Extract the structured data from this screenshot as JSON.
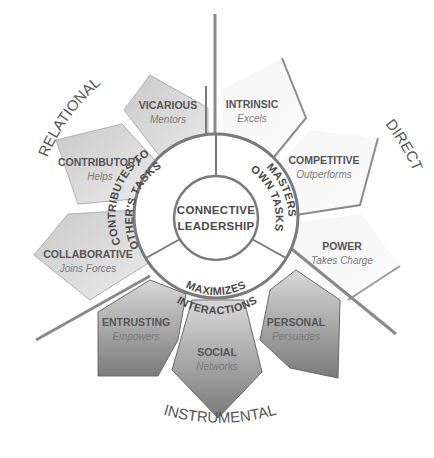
{
  "center": {
    "line1": "CONNECTIVE",
    "line2": "LEADERSHIP"
  },
  "ring_segments": [
    {
      "id": "contributes",
      "text": "CONTRIBUTES TO",
      "text2": "OTHER'S TASKS"
    },
    {
      "id": "masters",
      "text": "MASTERS",
      "text2": "OWN TASKS"
    },
    {
      "id": "maximizes",
      "text": "MAXIMIZES",
      "text2": "INTERACTIONS"
    }
  ],
  "dimensions": {
    "relational": "RELATIONAL",
    "direct": "DIRECT",
    "instrumental": "INSTRUMENTAL"
  },
  "petals": [
    {
      "id": "vicarious",
      "group": "relational",
      "label": "VICARIOUS",
      "sub": "Mentors"
    },
    {
      "id": "contributory",
      "group": "relational",
      "label": "CONTRIBUTORY",
      "sub": "Helps"
    },
    {
      "id": "collaborative",
      "group": "relational",
      "label": "COLLABORATIVE",
      "sub": "Joins Forces"
    },
    {
      "id": "intrinsic",
      "group": "direct",
      "label": "INTRINSIC",
      "sub": "Excels"
    },
    {
      "id": "competitive",
      "group": "direct",
      "label": "COMPETITIVE",
      "sub": "Outperforms"
    },
    {
      "id": "power",
      "group": "direct",
      "label": "POWER",
      "sub": "Takes Charge"
    },
    {
      "id": "entrusting",
      "group": "instrumental",
      "label": "ENTRUSTING",
      "sub": "Empowers"
    },
    {
      "id": "social",
      "group": "instrumental",
      "label": "SOCIAL",
      "sub": "Networks"
    },
    {
      "id": "personal",
      "group": "instrumental",
      "label": "PERSONAL",
      "sub": "Persuades"
    }
  ],
  "colors": {
    "relational_fill": "#d6d6d6",
    "direct_fill": "#f4f4f4",
    "instrumental_fill": "#9a9a9a",
    "outline": "#8a8a8a",
    "divider": "#888888"
  }
}
